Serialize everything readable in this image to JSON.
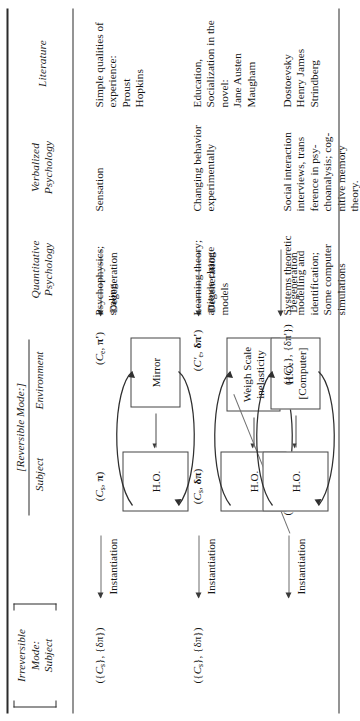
{
  "document": {
    "kind": "rotated-table",
    "orientation": "90deg-counterclockwise",
    "rules": {
      "top": "double-thick",
      "bottom": "single",
      "header": "single"
    }
  },
  "headers": {
    "group_irreversible": {
      "line1": "Irreversible Mode:",
      "line2": "Subject",
      "bracketed": true
    },
    "group_reversible": {
      "title": "[Reversible Mode:]",
      "sub": [
        {
          "label": "Subject"
        },
        {
          "label": "Environment"
        }
      ]
    },
    "columns": [
      {
        "key": "quantitative",
        "line1": "Quantitative",
        "line2": "Psychology"
      },
      {
        "key": "verbalized",
        "line1": "Verbalized",
        "line2": "Psychology"
      },
      {
        "key": "literature",
        "line1": "Literature",
        "line2": ""
      }
    ]
  },
  "rows": [
    {
      "id": "row-1",
      "irreversible_state": "({C_s}, {δπ})",
      "irreversible_state_parts": {
        "open": "({",
        "c": "C",
        "csub": "s",
        "mid": "}, {",
        "delta": "δπ",
        "close": "})"
      },
      "reversible_state": "(C_s, π)",
      "reversible_state_parts": {
        "open": "(",
        "c": "C",
        "csub": "s",
        "mid": ", ",
        "sym": "π",
        "close": ")"
      },
      "subject_box": "H.O.",
      "environment_box": "Mirror",
      "degenerate_state": "(C_e, π')",
      "degenerate_state_parts": {
        "open": "(",
        "c": "C",
        "csub": "e",
        "mid": ", ",
        "sym": "π'",
        "close": ")"
      },
      "quantitative": "Psychophysics;\nscaling",
      "verbalized": "Sensation",
      "literature": "Simple qualities of\nexperience:\nProust\nHopkins"
    },
    {
      "id": "row-2",
      "irreversible_state": "({C_s}, {δπ})",
      "irreversible_state_parts": {
        "open": "({",
        "c": "C",
        "csub": "s",
        "mid": "}, {",
        "delta": "δπ",
        "close": "})"
      },
      "reversible_state": "(C_s, δπ)",
      "reversible_state_parts": {
        "open": "(",
        "c": "C",
        "csub": "s",
        "mid": ", ",
        "sym": "δπ",
        "close": ")"
      },
      "subject_box": "H.O.",
      "environment_box": "Weigh Scale\ninelasticity",
      "degenerate_state": "(C'_e, δπ')",
      "degenerate_state_parts": {
        "open": "(",
        "c": "C'",
        "csub": "e",
        "mid": ", ",
        "sym": "δπ'",
        "close": ")"
      },
      "quantitative": "Learning theory;\nattitude change\nmodels",
      "verbalized": "Changing behavior\nexperimentally",
      "literature": "Education,\nSocialization in the\nnovel:\nJane Austen\nMaugham"
    },
    {
      "id": "row-3",
      "irreversible_state": "",
      "irreversible_state_parts": null,
      "reversible_state": "({C_s}, {δπ})",
      "reversible_state_parts": {
        "open": "({",
        "c": "C",
        "csub": "s",
        "mid": "}, {",
        "delta": "δπ",
        "close": "})"
      },
      "subject_box": "H.O.",
      "environment_box": "H.O.\n[Computer]",
      "degenerate_state": "({C'_e}, {δπ'})",
      "degenerate_state_parts": {
        "open": "({",
        "c": "C'",
        "csub": "e",
        "mid": "}, {",
        "delta": "δπ'",
        "close": "})"
      },
      "quantitative": "Systems theoretic\nmodelling and\nidentification;\nSome computer\nsimulations",
      "verbalized": "Social interaction\ninterviews, trans\nference in psy-\nchoanalysis; cog-\nnitive memory\ntheory.",
      "literature": "Dostoevsky\nHenry James\nStrindberg"
    }
  ],
  "arrows": {
    "instantiation_label": "Instantiation",
    "degeneration_label": "Degeneration",
    "direction": "leftward",
    "instantiation_count": 2,
    "degeneration_count": 4
  },
  "colors": {
    "text": "#141414",
    "rule": "#2b2b2b",
    "arrow": "#6d6d6d",
    "box_border": "#444444",
    "background": "#ffffff"
  }
}
